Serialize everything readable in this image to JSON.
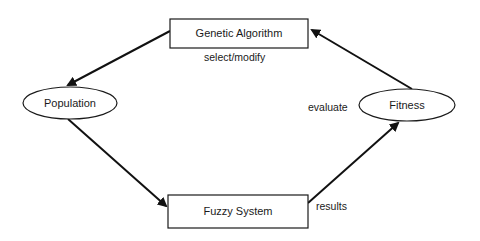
{
  "diagram": {
    "nodes": {
      "genetic_algorithm": {
        "label": "Genetic Algorithm",
        "shape": "rectangle"
      },
      "population": {
        "label": "Population",
        "shape": "ellipse"
      },
      "fitness": {
        "label": "Fitness",
        "shape": "ellipse"
      },
      "fuzzy_system": {
        "label": "Fuzzy System",
        "shape": "rectangle"
      }
    },
    "edges": [
      {
        "from": "Genetic Algorithm",
        "to": "Population",
        "label": "select/modify"
      },
      {
        "from": "Population",
        "to": "Fuzzy System",
        "label": ""
      },
      {
        "from": "Fuzzy System",
        "to": "Fitness",
        "label": "results"
      },
      {
        "from": "Fitness",
        "to": "Genetic Algorithm",
        "label": "evaluate"
      }
    ],
    "labels": {
      "select_modify": "select/modify",
      "evaluate": "evaluate",
      "results": "results"
    },
    "colors": {
      "stroke": "#1a1a1a",
      "background": "#ffffff"
    }
  }
}
